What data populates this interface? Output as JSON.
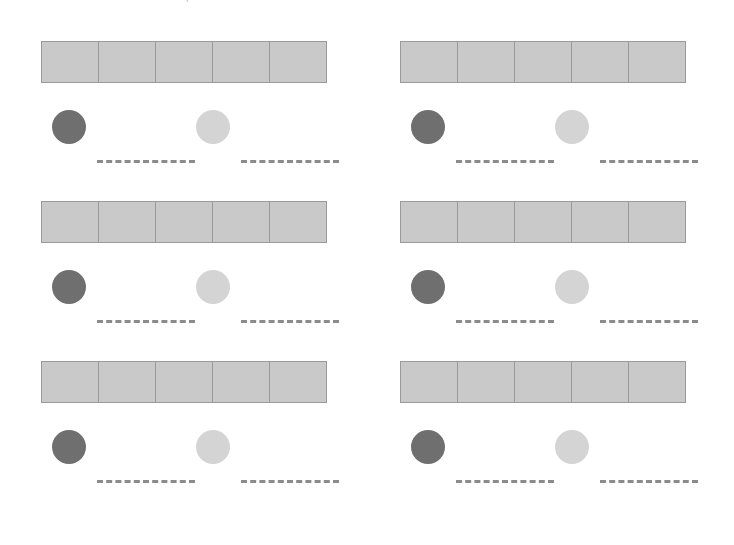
{
  "page": {
    "title": "Count the shaded squares and write the number on the line.",
    "background_color": "#ffffff",
    "width": 734,
    "height": 545
  },
  "colors": {
    "square_fill": "#c9c9c9",
    "square_border": "#9a9a9a",
    "dark_token": "#6f6f6f",
    "light_token": "#d4d4d4",
    "answer_line": "#8b8b8b",
    "title_text": "#c8c8cc"
  },
  "layout": {
    "columns": 2,
    "rows": 3,
    "squares_per_strip": 5,
    "tokens_per_group": 2
  },
  "exercises": [
    {
      "id": "exercise-1",
      "column": 0,
      "row": 0,
      "squares": [
        "",
        "",
        "",
        "",
        ""
      ],
      "tokens": [
        {
          "shade": "dark",
          "answer": ""
        },
        {
          "shade": "light",
          "answer": ""
        }
      ]
    },
    {
      "id": "exercise-2",
      "column": 1,
      "row": 0,
      "squares": [
        "",
        "",
        "",
        "",
        ""
      ],
      "tokens": [
        {
          "shade": "dark",
          "answer": ""
        },
        {
          "shade": "light",
          "answer": ""
        }
      ]
    },
    {
      "id": "exercise-3",
      "column": 0,
      "row": 1,
      "squares": [
        "",
        "",
        "",
        "",
        ""
      ],
      "tokens": [
        {
          "shade": "dark",
          "answer": ""
        },
        {
          "shade": "light",
          "answer": ""
        }
      ]
    },
    {
      "id": "exercise-4",
      "column": 1,
      "row": 1,
      "squares": [
        "",
        "",
        "",
        "",
        ""
      ],
      "tokens": [
        {
          "shade": "dark",
          "answer": ""
        },
        {
          "shade": "light",
          "answer": ""
        }
      ]
    },
    {
      "id": "exercise-5",
      "column": 0,
      "row": 2,
      "squares": [
        "",
        "",
        "",
        "",
        ""
      ],
      "tokens": [
        {
          "shade": "dark",
          "answer": ""
        },
        {
          "shade": "light",
          "answer": ""
        }
      ]
    },
    {
      "id": "exercise-6",
      "column": 1,
      "row": 2,
      "squares": [
        "",
        "",
        "",
        "",
        ""
      ],
      "tokens": [
        {
          "shade": "dark",
          "answer": ""
        },
        {
          "shade": "light",
          "answer": ""
        }
      ]
    }
  ]
}
